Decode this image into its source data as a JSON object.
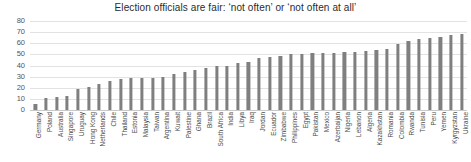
{
  "chart_data": {
    "type": "bar",
    "title": "Election officials are fair: ‘not often’ or ‘not often at all’",
    "xlabel": "",
    "ylabel": "",
    "ylim": [
      0,
      80
    ],
    "yticks": [
      0,
      10,
      20,
      30,
      40,
      50,
      60,
      70,
      80
    ],
    "grid": true,
    "legend": "none",
    "bar_color": "#7f7f7f",
    "categories": [
      "Germany",
      "Poland",
      "Australia",
      "Singapore",
      "Uruguay",
      "Hong Kong",
      "Netherlands",
      "Chile",
      "Thailand",
      "Estonia",
      "Malaysia",
      "Taiwan",
      "Argentina",
      "Kuwait",
      "Palestine",
      "Ghana",
      "Brazil",
      "South Africa",
      "India",
      "Libya",
      "Iraq",
      "Jordan",
      "Ecuador",
      "Zimbabwe",
      "Philippines",
      "Egypt",
      "Pakistan",
      "Mexico",
      "Azerbaijan",
      "Nigeria",
      "Lebanon",
      "Algeria",
      "Kazakhstan",
      "Romania",
      "Colombia",
      "Rwanda",
      "Tunisia",
      "Peru",
      "Yemen",
      "Kyrgyzstan",
      "Ukraine"
    ],
    "values": [
      5,
      11,
      12,
      13,
      19,
      21,
      23,
      26,
      28,
      29,
      29,
      29,
      30,
      32,
      34,
      36,
      38,
      40,
      40,
      42,
      43,
      47,
      48,
      49,
      50,
      50,
      51,
      51,
      51,
      52,
      52,
      53,
      54,
      55,
      59,
      62,
      64,
      65,
      66,
      67,
      68
    ]
  }
}
